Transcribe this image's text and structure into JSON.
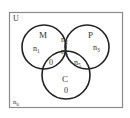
{
  "diagram": {
    "type": "venn",
    "universe_label": "U",
    "sets": [
      {
        "name": "M",
        "label": "M"
      },
      {
        "name": "P",
        "label": "P"
      },
      {
        "name": "C",
        "label": "C"
      }
    ],
    "regions": {
      "m_only": {
        "base": "n",
        "sub": "1"
      },
      "m_and_p_only": {
        "base": "n",
        "sub": "2"
      },
      "p_only": {
        "base": "n",
        "sub": "3"
      },
      "all_three": {
        "base": "n",
        "sub": "4"
      },
      "p_and_c_only": {
        "base": "n",
        "sub": "5"
      },
      "m_and_c_only": "0",
      "c_only": "0",
      "outside": {
        "base": "n",
        "sub": "6"
      }
    },
    "colors": {
      "stroke": "#222222",
      "border": "#888888",
      "background": "#ffffff"
    }
  }
}
